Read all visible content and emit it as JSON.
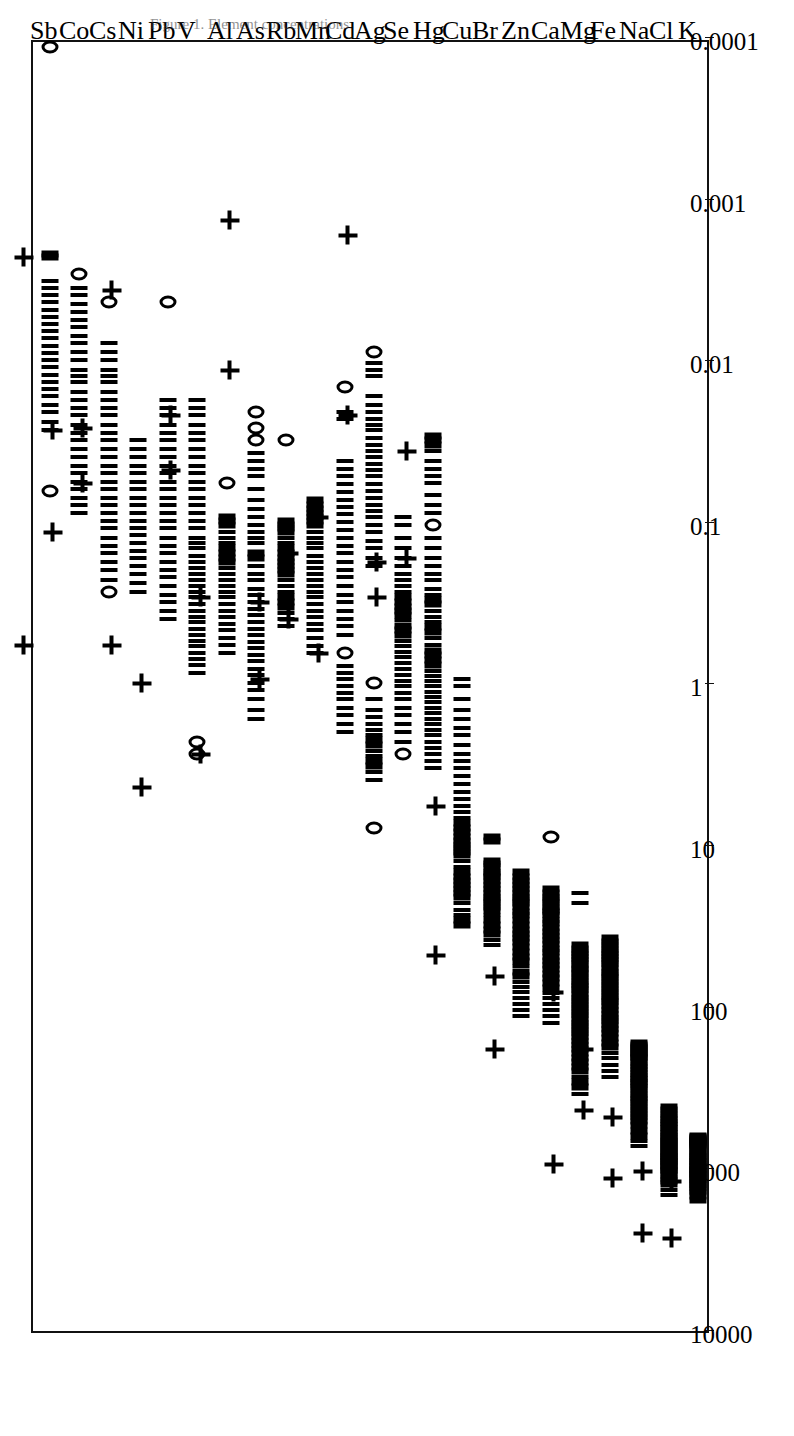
{
  "figure": {
    "caption": "Figure 1. Element concentrations",
    "orientation": "rotated-90",
    "frame_color": "#111111",
    "marker_color": "#000000"
  },
  "chart_data": {
    "type": "scatter",
    "title": "",
    "xlabel": "",
    "ylabel": "",
    "scale": "log",
    "grid": false,
    "legend": null,
    "value_axis": {
      "ticks": [
        10000,
        1000,
        100,
        10,
        1,
        0.1,
        0.01,
        0.001,
        0.0001
      ],
      "tick_labels": [
        "10000",
        "1000",
        "100",
        "10",
        "1",
        "0.1",
        "0.01",
        "0.001",
        "0.0001"
      ],
      "min": 0.0001,
      "max": 10000,
      "direction": "decreasing"
    },
    "categories": [
      "K",
      "Cl",
      "Na",
      "Fe",
      "Mg",
      "Ca",
      "Zn",
      "Br",
      "Cu",
      "Hg",
      "Se",
      "Ag",
      "Cd",
      "Mn",
      "Rb",
      "As",
      "Al",
      "V",
      "Pb",
      "Ni",
      "Cs",
      "Co",
      "Sb"
    ],
    "marker_legend": {
      "circle": "individual observation",
      "tick": "individual observation (overlapping)",
      "plus": "summary statistic"
    },
    "series": [
      {
        "name": "K",
        "points": [
          1500,
          1420,
          1350,
          1300,
          1260,
          1220,
          1190,
          1160,
          1130,
          1100,
          1080,
          1060,
          1040,
          1020,
          1000,
          980,
          960,
          940,
          920,
          900,
          880,
          860,
          840,
          820,
          800,
          780,
          760,
          740,
          720,
          700,
          690,
          680,
          670,
          660,
          650,
          640,
          630,
          620,
          610,
          600
        ],
        "summary": [
          2600,
          1150
        ]
      },
      {
        "name": "Cl",
        "points": [
          1400,
          1300,
          1200,
          1150,
          1100,
          1050,
          1000,
          980,
          950,
          920,
          900,
          880,
          860,
          840,
          820,
          800,
          780,
          760,
          740,
          720,
          700,
          680,
          660,
          640,
          620,
          600,
          580,
          560,
          540,
          520,
          500,
          480,
          460,
          440,
          420,
          400
        ],
        "summary": [
          2400,
          1000
        ]
      },
      {
        "name": "Na",
        "points": [
          700,
          650,
          600,
          560,
          520,
          490,
          460,
          440,
          420,
          400,
          380,
          360,
          345,
          330,
          315,
          300,
          290,
          280,
          270,
          260,
          250,
          240,
          230,
          220,
          210,
          200,
          195,
          190,
          185,
          180,
          175,
          170,
          165,
          160
        ],
        "summary": [
          1100,
          460
        ]
      },
      {
        "name": "Fe",
        "points": [
          260,
          240,
          220,
          200,
          185,
          170,
          160,
          150,
          140,
          132,
          125,
          118,
          112,
          106,
          100,
          95,
          90,
          86,
          82,
          78,
          74,
          70,
          67,
          64,
          61,
          58,
          55,
          52,
          50,
          48,
          46,
          44,
          42,
          40,
          38,
          36
        ],
        "summary": [
          420,
          175
        ]
      },
      {
        "name": "Mg",
        "points": [
          330,
          300,
          280,
          260,
          240,
          225,
          210,
          198,
          186,
          175,
          165,
          156,
          148,
          140,
          133,
          126,
          120,
          114,
          108,
          103,
          98,
          93,
          88,
          84,
          80,
          76,
          72,
          69,
          66,
          63,
          60,
          57,
          55,
          52,
          50,
          48,
          46,
          44,
          42,
          40,
          22,
          19
        ],
        "summary": [
          900,
          78
        ]
      },
      {
        "name": "Ca",
        "points": [
          120,
          110,
          100,
          92,
          85,
          79,
          73,
          68,
          64,
          60,
          56,
          53,
          50,
          47,
          44,
          42,
          39,
          37,
          35,
          33,
          31,
          29,
          28,
          26,
          25,
          24,
          23,
          22,
          21,
          20,
          19,
          18,
          8.5
        ],
        "summary": [
          null,
          null
        ]
      },
      {
        "name": "Zn",
        "points": [
          110,
          100,
          92,
          85,
          78,
          72,
          67,
          62,
          58,
          54,
          50,
          47,
          44,
          41,
          38,
          36,
          34,
          32,
          30,
          28,
          26,
          25,
          23,
          22,
          21,
          20,
          19,
          18,
          17,
          16,
          15,
          14
        ],
        "summary": [
          175,
          62
        ]
      },
      {
        "name": "Br",
        "points": [
          40,
          37,
          34,
          32,
          30,
          28,
          26,
          24,
          23,
          22,
          21,
          20,
          19,
          18,
          17,
          16,
          15,
          14.5,
          14,
          13,
          12.5,
          12,
          9,
          8.5
        ],
        "summary": [
          null,
          null
        ]
      },
      {
        "name": "Cu",
        "points": [
          30,
          28,
          26,
          24,
          22,
          20,
          19,
          18,
          17,
          16,
          15,
          14,
          13,
          12,
          11,
          10.5,
          10,
          9.5,
          9,
          8.5,
          8,
          7.5,
          7,
          6.5,
          6,
          5.5,
          5,
          4.5,
          4,
          3.6,
          3.2,
          2.9,
          2.6,
          2.3,
          2.0,
          1.8,
          1.6,
          1.4,
          1.2,
          1.0,
          0.9
        ],
        "summary": [
          46,
          5.5
        ]
      },
      {
        "name": "Hg",
        "points": [
          3.2,
          2.9,
          2.6,
          2.4,
          2.2,
          2.0,
          1.85,
          1.7,
          1.58,
          1.46,
          1.35,
          1.25,
          1.16,
          1.08,
          1.0,
          0.93,
          0.86,
          0.8,
          0.74,
          0.69,
          0.64,
          0.6,
          0.55,
          0.5,
          0.46,
          0.43,
          0.4,
          0.37,
          0.34,
          0.31,
          0.29,
          0.27,
          0.25,
          0.22,
          0.2,
          0.18,
          0.16,
          0.14,
          0.12,
          0.1,
          0.085,
          0.075,
          0.065,
          0.055,
          0.05,
          0.045,
          0.04,
          0.035,
          0.032,
          0.03,
          0.028
        ],
        "summary": [
          0.16,
          0.035
        ]
      },
      {
        "name": "Se",
        "points": [
          2.6,
          2.2,
          1.9,
          1.7,
          1.5,
          1.35,
          1.2,
          1.1,
          1.0,
          0.92,
          0.85,
          0.78,
          0.72,
          0.66,
          0.61,
          0.56,
          0.52,
          0.48,
          0.45,
          0.42,
          0.39,
          0.36,
          0.34,
          0.32,
          0.3,
          0.28,
          0.26,
          0.24,
          0.22,
          0.2,
          0.18,
          0.16,
          0.14,
          0.12,
          0.1,
          0.09
        ],
        "summary": [
          0.28,
          0.17
        ]
      },
      {
        "name": "Ag",
        "points": [
          7.5,
          3.8,
          3.4,
          3.1,
          2.9,
          2.7,
          2.5,
          2.3,
          2.15,
          2.0,
          1.85,
          1.7,
          1.55,
          1.4,
          1.2,
          0.95,
          0.18,
          0.16,
          0.14,
          0.125,
          0.11,
          0.1,
          0.09,
          0.082,
          0.075,
          0.068,
          0.062,
          0.056,
          0.05,
          0.046,
          0.042,
          0.038,
          0.035,
          0.032,
          0.029,
          0.026,
          0.024,
          0.022,
          0.02,
          0.018,
          0.016,
          0.012,
          0.011,
          0.01,
          0.0085
        ],
        "summary": [
          0.021,
          0.0016
        ]
      },
      {
        "name": "Cd",
        "points": [
          1.9,
          1.7,
          1.5,
          1.35,
          1.2,
          1.1,
          1.0,
          0.9,
          0.82,
          0.75,
          0.62,
          0.48,
          0.42,
          0.38,
          0.34,
          0.3,
          0.27,
          0.24,
          0.21,
          0.19,
          0.17,
          0.15,
          0.135,
          0.12,
          0.108,
          0.096,
          0.086,
          0.078,
          0.07,
          0.063,
          0.056,
          0.05,
          0.045,
          0.04,
          0.022,
          0.02,
          0.014
        ],
        "summary": [
          0.62,
          0.09
        ]
      },
      {
        "name": "Mn",
        "points": [
          0.62,
          0.56,
          0.5,
          0.45,
          0.41,
          0.37,
          0.34,
          0.31,
          0.28,
          0.26,
          0.24,
          0.22,
          0.2,
          0.185,
          0.17,
          0.155,
          0.14,
          0.13,
          0.12,
          0.11,
          0.1,
          0.095,
          0.09,
          0.085,
          0.08,
          0.075,
          0.07
        ],
        "summary": [
          0.38,
          0.15
        ]
      },
      {
        "name": "Rb",
        "points": [
          0.42,
          0.38,
          0.35,
          0.32,
          0.3,
          0.28,
          0.26,
          0.24,
          0.22,
          0.2,
          0.19,
          0.18,
          0.17,
          0.16,
          0.15,
          0.14,
          0.13,
          0.12,
          0.11,
          0.105,
          0.1,
          0.095,
          0.03
        ],
        "summary": [
          0.9,
          0.3
        ]
      },
      {
        "name": "As",
        "points": [
          1.6,
          1.4,
          1.2,
          1.05,
          0.95,
          0.85,
          0.78,
          0.7,
          0.64,
          0.58,
          0.53,
          0.48,
          0.44,
          0.4,
          0.36,
          0.33,
          0.3,
          0.27,
          0.25,
          0.22,
          0.2,
          0.18,
          0.16,
          0.15,
          0.13,
          0.12,
          0.11,
          0.1,
          0.09,
          0.08,
          0.07,
          0.06,
          0.05,
          0.045,
          0.04,
          0.036,
          0.03,
          0.025,
          0.02
        ],
        "summary": [
          0.011,
          0.0013
        ]
      },
      {
        "name": "Al",
        "points": [
          0.62,
          0.55,
          0.5,
          0.45,
          0.41,
          0.37,
          0.34,
          0.31,
          0.28,
          0.26,
          0.24,
          0.22,
          0.2,
          0.185,
          0.17,
          0.16,
          0.15,
          0.14,
          0.13,
          0.12,
          0.11,
          0.1,
          0.095,
          0.09,
          0.055
        ],
        "summary": [
          2.6,
          0.28
        ]
      },
      {
        "name": "V",
        "points": [
          2.6,
          2.2,
          0.82,
          0.74,
          0.68,
          0.62,
          0.56,
          0.52,
          0.48,
          0.44,
          0.4,
          0.37,
          0.34,
          0.31,
          0.28,
          0.26,
          0.24,
          0.22,
          0.2,
          0.185,
          0.17,
          0.155,
          0.14,
          0.13,
          0.12,
          0.105,
          0.095,
          0.085,
          0.075,
          0.068,
          0.06,
          0.054,
          0.048,
          0.043,
          0.038,
          0.034,
          0.03,
          0.027,
          0.024,
          0.021,
          0.019,
          0.017
        ],
        "summary": [
          0.046,
          0.021
        ]
      },
      {
        "name": "Pb",
        "points": [
          0.38,
          0.34,
          0.3,
          0.27,
          0.24,
          0.21,
          0.19,
          0.17,
          0.15,
          0.135,
          0.12,
          0.105,
          0.095,
          0.085,
          0.075,
          0.068,
          0.06,
          0.054,
          0.048,
          0.043,
          0.038,
          0.034,
          0.03,
          0.027,
          0.024,
          0.021,
          0.019,
          0.017,
          0.0042
        ],
        "summary": [
          4.2,
          0.95
        ]
      },
      {
        "name": "Ni",
        "points": [
          0.26,
          0.23,
          0.2,
          0.18,
          0.16,
          0.145,
          0.13,
          0.115,
          0.105,
          0.095,
          0.085,
          0.075,
          0.068,
          0.06,
          0.054,
          0.048,
          0.043,
          0.038,
          0.034,
          0.03
        ],
        "summary": [
          0.55,
          0.0035
        ]
      },
      {
        "name": "Cs",
        "points": [
          0.26,
          0.22,
          0.19,
          0.17,
          0.15,
          0.135,
          0.12,
          0.105,
          0.095,
          0.085,
          0.075,
          0.068,
          0.06,
          0.054,
          0.048,
          0.043,
          0.038,
          0.034,
          0.03,
          0.027,
          0.024,
          0.021,
          0.019,
          0.017,
          0.015,
          0.013,
          0.012,
          0.011,
          0.0095,
          0.0085,
          0.0075,
          0.0042
        ],
        "summary": [
          0.055,
          0.025
        ]
      },
      {
        "name": "Co",
        "points": [
          0.085,
          0.075,
          0.068,
          0.06,
          0.054,
          0.048,
          0.043,
          0.038,
          0.034,
          0.03,
          0.027,
          0.024,
          0.021,
          0.019,
          0.017,
          0.015,
          0.013,
          0.012,
          0.011,
          0.0095,
          0.0085,
          0.0075,
          0.0068,
          0.006,
          0.0054,
          0.0048,
          0.0043,
          0.0038,
          0.0034,
          0.0028
        ],
        "summary": [
          0.11,
          0.026
        ]
      },
      {
        "name": "Sb",
        "points": [
          0.062,
          0.026,
          0.023,
          0.02,
          0.018,
          0.016,
          0.0145,
          0.013,
          0.0118,
          0.0106,
          0.0095,
          0.0086,
          0.0078,
          0.007,
          0.0063,
          0.0057,
          0.0052,
          0.0047,
          0.0042,
          0.0038,
          0.0034,
          0.0031,
          0.0022,
          0.0021,
          0.00011
        ],
        "summary": [
          0.55,
          0.0022
        ]
      }
    ]
  }
}
